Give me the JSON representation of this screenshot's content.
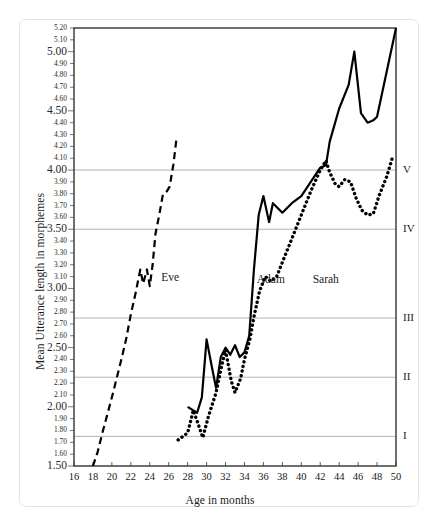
{
  "chart_data": {
    "type": "line",
    "title": "",
    "xlabel": "Age in months",
    "ylabel": "Mean Utterance length in morphemes",
    "xlim": [
      16,
      50
    ],
    "ylim": [
      1.5,
      5.2
    ],
    "grid": true,
    "legend_position": "inline-annotation",
    "xticks": [
      16,
      18,
      20,
      22,
      24,
      26,
      28,
      30,
      32,
      34,
      36,
      38,
      40,
      42,
      44,
      46,
      48,
      50
    ],
    "yticks": [
      1.5,
      1.6,
      1.7,
      1.8,
      1.9,
      2.0,
      2.1,
      2.2,
      2.3,
      2.4,
      2.5,
      2.6,
      2.7,
      2.8,
      2.9,
      3.0,
      3.1,
      3.2,
      3.3,
      3.4,
      3.5,
      3.6,
      3.7,
      3.8,
      3.9,
      4.0,
      4.1,
      4.2,
      4.3,
      4.4,
      4.5,
      4.6,
      4.7,
      4.8,
      4.9,
      5.0,
      5.1,
      5.2
    ],
    "ytick_labels": [
      "1.50",
      "1.60",
      "1.70",
      "1.80",
      "1.90",
      "2.00",
      "2.10",
      "2.20",
      "2.30",
      "2.40",
      "2.50",
      "2.60",
      "2.70",
      "2.80",
      "2.90",
      "3.00",
      "3.10",
      "3.20",
      "3.30",
      "3.40",
      "3.50",
      "3.60",
      "3.70",
      "3.80",
      "3.90",
      "4.00",
      "4.10",
      "4.20",
      "4.30",
      "4.40",
      "4.50",
      "4.60",
      "4.70",
      "4.80",
      "4.90",
      "5.00",
      "5.10",
      "5.20"
    ],
    "ytick_major": [
      1.5,
      2.0,
      2.5,
      3.0,
      3.5,
      4.0,
      4.5,
      5.0
    ],
    "gridlines": [
      {
        "value": 1.75,
        "label": "I"
      },
      {
        "value": 2.25,
        "label": "II"
      },
      {
        "value": 2.75,
        "label": "III"
      },
      {
        "value": 3.5,
        "label": "IV"
      },
      {
        "value": 4.0,
        "label": "V"
      }
    ],
    "stage_axis_note": "Brown's stages I-V marked on right axis",
    "series": [
      {
        "name": "Eve",
        "style": "dashed",
        "color": "#000000",
        "label_x": 25.2,
        "label_y": 3.09,
        "points": [
          [
            18.0,
            1.5
          ],
          [
            18.5,
            1.62
          ],
          [
            19.0,
            1.78
          ],
          [
            19.5,
            1.93
          ],
          [
            20.0,
            2.08
          ],
          [
            20.5,
            2.24
          ],
          [
            21.0,
            2.4
          ],
          [
            21.5,
            2.57
          ],
          [
            22.0,
            2.78
          ],
          [
            22.5,
            2.96
          ],
          [
            23.0,
            3.16
          ],
          [
            23.3,
            3.04
          ],
          [
            23.7,
            3.16
          ],
          [
            24.0,
            3.02
          ],
          [
            24.3,
            3.2
          ],
          [
            24.6,
            3.46
          ],
          [
            25.0,
            3.62
          ],
          [
            25.4,
            3.8
          ],
          [
            25.8,
            3.82
          ],
          [
            26.1,
            3.86
          ],
          [
            26.5,
            4.05
          ],
          [
            26.8,
            4.25
          ]
        ]
      },
      {
        "name": "Adam",
        "style": "solid",
        "color": "#000000",
        "label_x": 35.3,
        "label_y": 3.07,
        "points": [
          [
            28.0,
            2.0
          ],
          [
            29.0,
            1.95
          ],
          [
            29.5,
            2.08
          ],
          [
            30.0,
            2.57
          ],
          [
            30.6,
            2.32
          ],
          [
            31.0,
            2.16
          ],
          [
            31.5,
            2.42
          ],
          [
            32.0,
            2.5
          ],
          [
            32.5,
            2.44
          ],
          [
            33.0,
            2.52
          ],
          [
            33.5,
            2.42
          ],
          [
            34.0,
            2.46
          ],
          [
            34.5,
            2.6
          ],
          [
            35.0,
            3.16
          ],
          [
            35.5,
            3.62
          ],
          [
            36.0,
            3.78
          ],
          [
            36.6,
            3.56
          ],
          [
            37.0,
            3.72
          ],
          [
            38.0,
            3.64
          ],
          [
            39.0,
            3.72
          ],
          [
            40.0,
            3.78
          ],
          [
            41.0,
            3.9
          ],
          [
            42.0,
            4.02
          ],
          [
            42.6,
            4.04
          ],
          [
            43.0,
            4.24
          ],
          [
            44.0,
            4.52
          ],
          [
            45.0,
            4.72
          ],
          [
            45.6,
            5.0
          ],
          [
            46.3,
            4.48
          ],
          [
            47.0,
            4.4
          ],
          [
            47.6,
            4.42
          ],
          [
            48.0,
            4.45
          ],
          [
            50.0,
            5.2
          ]
        ]
      },
      {
        "name": "Sarah",
        "style": "dotted",
        "color": "#000000",
        "label_x": 41.2,
        "label_y": 3.07,
        "points": [
          [
            27.0,
            1.72
          ],
          [
            28.0,
            1.78
          ],
          [
            28.6,
            1.97
          ],
          [
            29.0,
            1.88
          ],
          [
            29.6,
            1.74
          ],
          [
            30.2,
            1.92
          ],
          [
            31.0,
            2.12
          ],
          [
            31.6,
            2.35
          ],
          [
            32.0,
            2.48
          ],
          [
            32.6,
            2.22
          ],
          [
            33.0,
            2.12
          ],
          [
            33.6,
            2.24
          ],
          [
            34.0,
            2.4
          ],
          [
            34.6,
            2.58
          ],
          [
            35.0,
            2.76
          ],
          [
            35.6,
            2.98
          ],
          [
            36.2,
            3.1
          ],
          [
            36.8,
            3.06
          ],
          [
            37.4,
            3.1
          ],
          [
            38.0,
            3.22
          ],
          [
            39.0,
            3.42
          ],
          [
            40.0,
            3.62
          ],
          [
            41.0,
            3.82
          ],
          [
            42.0,
            4.0
          ],
          [
            42.6,
            4.08
          ],
          [
            43.0,
            3.98
          ],
          [
            43.6,
            3.88
          ],
          [
            44.0,
            3.86
          ],
          [
            44.6,
            3.92
          ],
          [
            45.2,
            3.9
          ],
          [
            45.8,
            3.76
          ],
          [
            46.4,
            3.66
          ],
          [
            47.0,
            3.62
          ],
          [
            47.6,
            3.63
          ],
          [
            48.2,
            3.78
          ],
          [
            49.0,
            3.94
          ],
          [
            49.6,
            4.1
          ]
        ]
      }
    ]
  }
}
